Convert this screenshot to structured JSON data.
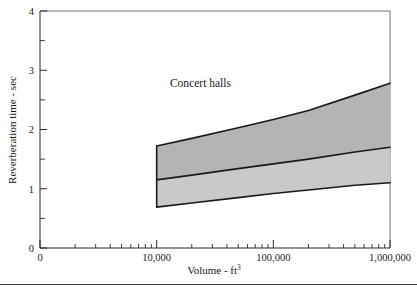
{
  "figure": {
    "background_color": "#ffffff",
    "bottom_rule": true
  },
  "chart_data": {
    "type": "area",
    "title": "",
    "subtitle": "",
    "xlabel": "Volume - ft",
    "xlabel_superscript": "3",
    "ylabel": "Reverberation time - sec",
    "xscale": "log",
    "yscale": "linear",
    "xlim": [
      1000,
      1000000
    ],
    "ylim": [
      0,
      4
    ],
    "grid": false,
    "legend_position": "none",
    "annotations": [
      {
        "text": "Concert halls",
        "x": 13000,
        "y": 2.72
      }
    ],
    "x_tick_labels": [
      {
        "value": 1000,
        "label": "0"
      },
      {
        "value": 10000,
        "label": "10,000"
      },
      {
        "value": 100000,
        "label": "100,000"
      },
      {
        "value": 1000000,
        "label": "1,000,000"
      }
    ],
    "x_minor_ticks": [
      2000,
      3000,
      4000,
      5000,
      6000,
      7000,
      8000,
      9000,
      20000,
      30000,
      40000,
      50000,
      60000,
      70000,
      80000,
      90000,
      200000,
      300000,
      400000,
      500000,
      600000,
      700000,
      800000,
      900000
    ],
    "y_tick_labels": [
      {
        "value": 0,
        "label": "0"
      },
      {
        "value": 1,
        "label": "1"
      },
      {
        "value": 2,
        "label": "2"
      },
      {
        "value": 3,
        "label": "3"
      },
      {
        "value": 4,
        "label": "4"
      }
    ],
    "y_minor_ticks": [
      0.5,
      1.5,
      2.5,
      3.5
    ],
    "x": [
      10000,
      20000,
      50000,
      100000,
      200000,
      500000,
      1000000
    ],
    "series": [
      {
        "name": "upper bound",
        "role": "upper",
        "values": [
          1.72,
          1.85,
          2.03,
          2.17,
          2.32,
          2.58,
          2.78
        ]
      },
      {
        "name": "mean",
        "role": "middle",
        "values": [
          1.15,
          1.23,
          1.34,
          1.42,
          1.5,
          1.62,
          1.7
        ]
      },
      {
        "name": "lower bound",
        "role": "lower",
        "values": [
          0.69,
          0.76,
          0.85,
          0.92,
          0.98,
          1.06,
          1.1
        ]
      }
    ],
    "bands": [
      {
        "name": "upper band",
        "from": "mean",
        "to": "upper bound",
        "color": "#b4b4b4"
      },
      {
        "name": "lower band",
        "from": "lower bound",
        "to": "mean",
        "color": "#c9c9c9"
      }
    ]
  }
}
